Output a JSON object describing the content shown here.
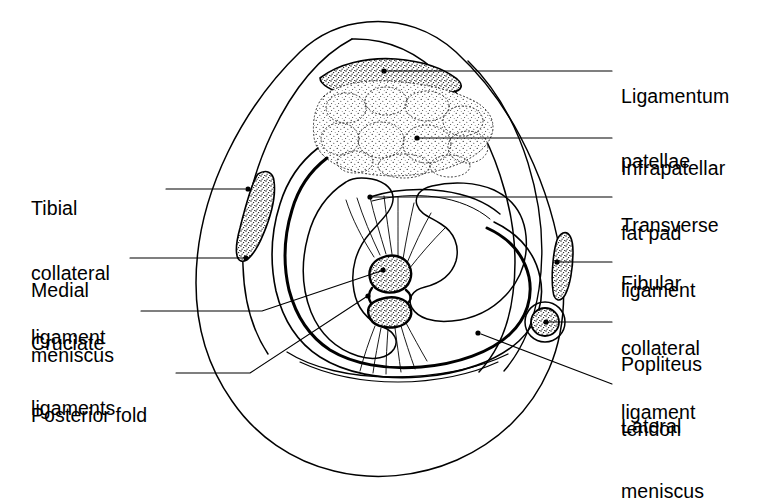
{
  "figure": {
    "type": "anatomical-cross-section",
    "region": "knee joint",
    "style": "line drawing with stippled shading",
    "colors": {
      "background": "#ffffff",
      "ink": "#000000",
      "stipple": "#1a1a1a"
    }
  },
  "labels": {
    "left": [
      {
        "id": "tibial-collateral-ligament",
        "text": "Tibial\ncollateral\nligament",
        "lines": [
          "Tibial",
          "collateral",
          "ligament"
        ],
        "x": 31,
        "y": 155,
        "leader": {
          "from": [
            166,
            189
          ],
          "to": [
            245,
            189
          ],
          "marker": "dot"
        }
      },
      {
        "id": "medial-meniscus",
        "text": "Medial\nmeniscus",
        "lines": [
          "Medial",
          "meniscus"
        ],
        "x": 31,
        "y": 237,
        "leader": {
          "from": [
            130,
            258
          ],
          "to": [
            246,
            258
          ],
          "marker": "dot"
        }
      },
      {
        "id": "cruciate-ligaments",
        "text": "Cruciate\nligaments",
        "lines": [
          "Cruciate",
          "ligaments"
        ],
        "x": 31,
        "y": 290,
        "leader": {
          "from": [
            141,
            311
          ],
          "to": [
            262,
            311
          ],
          "marker": "none"
        }
      },
      {
        "id": "posterior-fold",
        "text": "Posterior fold",
        "lines": [
          "Posterior fold"
        ],
        "x": 31,
        "y": 362,
        "leader": {
          "from": [
            176,
            373
          ],
          "to": [
            250,
            373
          ],
          "marker": "none"
        }
      }
    ],
    "right": [
      {
        "id": "ligamentum-patellae",
        "text": "Ligamentum\npatellae",
        "lines": [
          "Ligamentum",
          "patellae"
        ],
        "x": 621,
        "y": 43,
        "leader": {
          "from": [
            383,
            71
          ],
          "to": [
            612,
            71
          ],
          "marker": "dot"
        }
      },
      {
        "id": "infrapatellar-fat-pad",
        "text": "Infrapatellar\nfat pad",
        "lines": [
          "Infrapatellar",
          "fat pad"
        ],
        "x": 621,
        "y": 115,
        "leader": {
          "from": [
            417,
            138
          ],
          "to": [
            612,
            138
          ],
          "marker": "dot"
        }
      },
      {
        "id": "transverse-ligament",
        "text": "Transverse\nligament",
        "lines": [
          "Transverse",
          "ligament"
        ],
        "x": 621,
        "y": 172,
        "leader": {
          "from": [
            370,
            197
          ],
          "to": [
            612,
            197
          ],
          "marker": "dot"
        }
      },
      {
        "id": "fibular-collateral-ligament",
        "text": "Fibular\ncollateral\nligament",
        "lines": [
          "Fibular",
          "collateral",
          "ligament"
        ],
        "x": 621,
        "y": 230,
        "leader": {
          "from": [
            557,
            262
          ],
          "to": [
            612,
            262
          ],
          "marker": "dot"
        }
      },
      {
        "id": "popliteus-tendon",
        "text": "Popliteus\ntendon",
        "lines": [
          "Popliteus",
          "tendon"
        ],
        "x": 621,
        "y": 311,
        "leader": {
          "from": [
            536,
            322
          ],
          "to": [
            612,
            322
          ],
          "marker": "dot"
        }
      },
      {
        "id": "lateral-meniscus",
        "text": "Lateral\nmeniscus",
        "lines": [
          "Lateral",
          "meniscus"
        ],
        "x": 621,
        "y": 373,
        "leader": {
          "from": [
            478,
            333
          ],
          "to": [
            612,
            384
          ],
          "marker": "dot"
        }
      }
    ]
  },
  "structures": [
    {
      "id": "skin-outline",
      "name": "outer skin contour",
      "shading": "none"
    },
    {
      "id": "ligamentum-patellae",
      "name": "ligamentum patellae",
      "shading": "stipple-dense"
    },
    {
      "id": "infrapatellar-fat-pad",
      "name": "infrapatellar fat pad",
      "shading": "stipple-lobulated"
    },
    {
      "id": "tibial-collateral-ligament",
      "name": "tibial collateral ligament",
      "shading": "stipple-dense"
    },
    {
      "id": "fibular-collateral-ligament",
      "name": "fibular collateral ligament",
      "shading": "stipple-dense"
    },
    {
      "id": "popliteus-tendon",
      "name": "popliteus tendon",
      "shading": "stipple-dense"
    },
    {
      "id": "medial-meniscus",
      "name": "medial meniscus",
      "shading": "none"
    },
    {
      "id": "lateral-meniscus",
      "name": "lateral meniscus",
      "shading": "none"
    },
    {
      "id": "cruciate-anterior",
      "name": "anterior cruciate ligament",
      "shading": "stipple-dense"
    },
    {
      "id": "cruciate-posterior",
      "name": "posterior cruciate ligament",
      "shading": "stipple-dense"
    },
    {
      "id": "transverse-ligament",
      "name": "transverse ligament",
      "shading": "none"
    },
    {
      "id": "posterior-fold",
      "name": "posterior fold",
      "shading": "none"
    }
  ]
}
